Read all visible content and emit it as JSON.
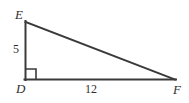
{
  "figure": {
    "type": "right-triangle-diagram",
    "background_color": "#ffffff",
    "stroke_color": "#3a3a3a",
    "text_color": "#2f2f2f",
    "vertices": {
      "E": {
        "label": "E",
        "x": 25,
        "y": 22
      },
      "D": {
        "label": "D",
        "x": 25,
        "y": 80
      },
      "F": {
        "label": "F",
        "x": 175,
        "y": 80
      }
    },
    "right_angle": {
      "at_vertex": "D",
      "marker": "right-angle-square",
      "size": 10
    },
    "sides": {
      "vertical_leg": {
        "from": "D",
        "to": "E",
        "measure": "5"
      },
      "horizontal_leg": {
        "from": "D",
        "to": "F",
        "measure": "12"
      },
      "hypotenuse": {
        "from": "E",
        "to": "F",
        "measure": ""
      }
    }
  }
}
